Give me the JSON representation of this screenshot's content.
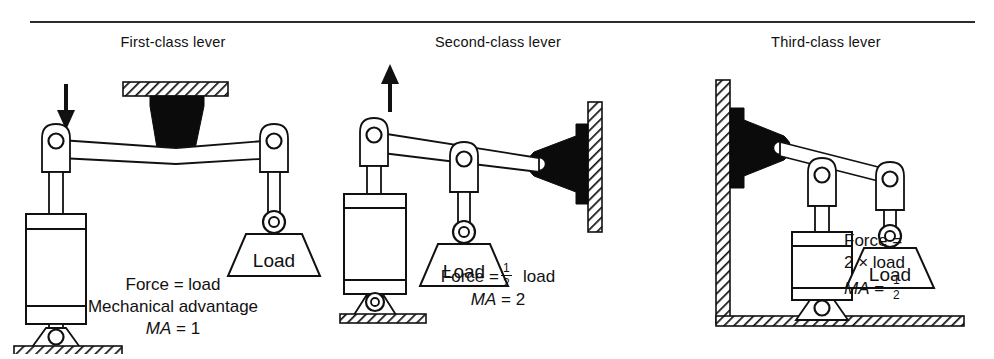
{
  "figure": {
    "rule_color": "#2b2b2b",
    "background": "#ffffff",
    "ink_color": "#111111",
    "fill_color": "#000000"
  },
  "panels": [
    {
      "id": "first-class",
      "title": "First-class lever",
      "load_label": "Load",
      "force_arrow": "down-arrow",
      "fulcrum": "ceiling-bracket",
      "caption": {
        "line1": "Force = load",
        "line2": "Mechanical advantage",
        "line3_ma": "MA",
        "line3_eq": "= 1"
      }
    },
    {
      "id": "second-class",
      "title": "Second-class lever",
      "load_label": "Load",
      "force_arrow": "up-arrow",
      "fulcrum": "wall-bracket-right",
      "caption": {
        "force_prefix": "Force =",
        "force_num": "1",
        "force_den": "2",
        "force_suffix": "load",
        "ma_label": "MA",
        "ma_value": "= 2"
      }
    },
    {
      "id": "third-class",
      "title": "Third-class lever",
      "load_label": "Load",
      "force_arrow": "none",
      "fulcrum": "wall-bracket-left",
      "caption": {
        "line1": "Force =",
        "line2": "2 × load",
        "ma_label": "MA",
        "ma_eq": "=",
        "ma_num": "1",
        "ma_den": "2"
      }
    }
  ]
}
